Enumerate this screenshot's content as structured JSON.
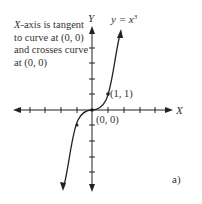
{
  "annotation": {
    "axis_name": "X",
    "line1_rest": "-axis is tangent",
    "line2": "to curve at (0, 0)",
    "line3": "and crosses curve",
    "line4": "at (0, 0)"
  },
  "axes": {
    "x_label": "X",
    "y_label": "Y"
  },
  "curve": {
    "equation_lhs": "y = x",
    "equation_exp": "3"
  },
  "points": [
    {
      "label": "(1, 1)"
    },
    {
      "label": "(0, 0)"
    }
  ],
  "panel_label": "a)",
  "colors": {
    "ink": "#222222",
    "background": "#ffffff"
  }
}
